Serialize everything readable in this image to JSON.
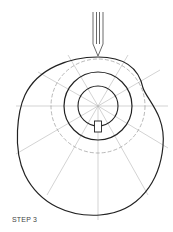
{
  "diagram": {
    "type": "cam-profile-construction",
    "caption": "STEP 3",
    "center": [
      98,
      106
    ],
    "circles": [
      {
        "name": "base-circle",
        "r": 20,
        "style": "solid"
      },
      {
        "name": "prime-circle",
        "r": 34,
        "style": "solid"
      },
      {
        "name": "trace-circle",
        "r": 47,
        "style": "dashed"
      }
    ],
    "radial_lines": 12,
    "colors": {
      "line": "#222222",
      "construction": "#aaaaaa"
    }
  }
}
